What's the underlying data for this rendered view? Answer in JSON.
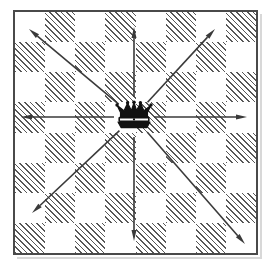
{
  "figure": {
    "width": 273,
    "height": 268
  },
  "board": {
    "rows": 8,
    "columns": 8,
    "light_color": "#ffffff",
    "dark_color": "#575757",
    "dark_fill_style": "diagonal-hatch",
    "frame_color": "#4a4a4a",
    "frame_width": 2,
    "shadow_color": "#d8d8d8",
    "squares": [
      [
        "light",
        "dark",
        "light",
        "dark",
        "light",
        "dark",
        "light",
        "dark"
      ],
      [
        "dark",
        "light",
        "dark",
        "light",
        "dark",
        "light",
        "dark",
        "light"
      ],
      [
        "light",
        "dark",
        "light",
        "dark",
        "light",
        "dark",
        "light",
        "dark"
      ],
      [
        "dark",
        "light",
        "dark",
        "light",
        "dark",
        "light",
        "dark",
        "light"
      ],
      [
        "light",
        "dark",
        "light",
        "dark",
        "light",
        "dark",
        "light",
        "dark"
      ],
      [
        "dark",
        "light",
        "dark",
        "light",
        "dark",
        "light",
        "dark",
        "light"
      ],
      [
        "light",
        "dark",
        "light",
        "dark",
        "light",
        "dark",
        "light",
        "dark"
      ],
      [
        "dark",
        "light",
        "dark",
        "light",
        "dark",
        "light",
        "dark",
        "light"
      ]
    ]
  },
  "piece": {
    "name": "queen",
    "glyph": "♕",
    "row": 3,
    "column": 3,
    "color": "#111111"
  },
  "arrows": {
    "color": "#3a3a3a",
    "stroke_width": 1.6,
    "head_length": 11,
    "head_width": 5,
    "count": 8,
    "origin": {
      "x": 134,
      "y": 117
    },
    "directions": [
      {
        "name": "north",
        "tip_x": 134,
        "tip_y": 27
      },
      {
        "name": "north-east",
        "tip_x": 215,
        "tip_y": 29
      },
      {
        "name": "east",
        "tip_x": 247,
        "tip_y": 117
      },
      {
        "name": "south-east",
        "tip_x": 245,
        "tip_y": 244
      },
      {
        "name": "south",
        "tip_x": 134,
        "tip_y": 241
      },
      {
        "name": "south-west",
        "tip_x": 32,
        "tip_y": 213
      },
      {
        "name": "west",
        "tip_x": 21,
        "tip_y": 117
      },
      {
        "name": "north-west",
        "tip_x": 29,
        "tip_y": 29
      }
    ]
  }
}
